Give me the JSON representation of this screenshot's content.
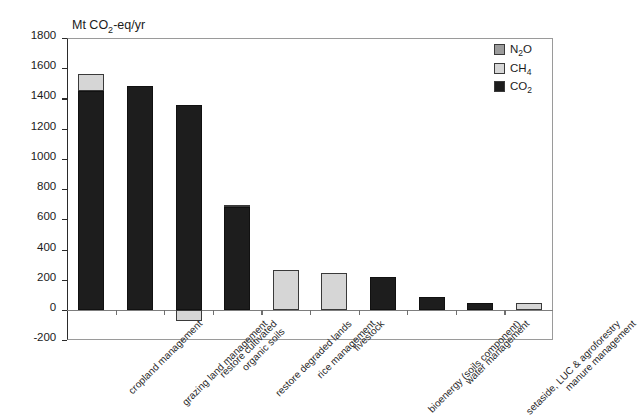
{
  "chart_data": {
    "type": "bar",
    "stacked": true,
    "title": "Mt CO2-eq/yr",
    "title_html": "Mt CO<sub>2</sub>-eq/yr",
    "xlabel": "",
    "ylabel": "Mt CO2-eq/yr",
    "ylim": [
      -200,
      1800
    ],
    "ytick_step": 200,
    "yticks": [
      1800,
      1600,
      1400,
      1200,
      1000,
      800,
      600,
      400,
      200,
      0,
      -200
    ],
    "ytick_labels": [
      "1800",
      "1600",
      "1400",
      "1200",
      "1000",
      "800",
      "600",
      "400",
      "200",
      "0",
      "-200"
    ],
    "grid": false,
    "legend_position": "top-right",
    "categories": [
      "cropland management",
      "grazing land management",
      "restore cultivated organic soils",
      "restore degraded lands",
      "rice management",
      "livestock",
      "bioenergy (soils component)",
      "water management",
      "setaside, LUC & agroforestry",
      "manure management"
    ],
    "category_lines": [
      [
        "cropland management"
      ],
      [
        "grazing land management"
      ],
      [
        "restore cultivated",
        "organic soils"
      ],
      [
        "restore degraded lands"
      ],
      [
        "rice management"
      ],
      [
        "livestock"
      ],
      [
        "bioenergy (soils component)"
      ],
      [
        "water management"
      ],
      [
        "setaside, LUC & agroforestry"
      ],
      [
        "manure management"
      ]
    ],
    "series": [
      {
        "name": "CO2",
        "name_html": "CO<sub>2</sub>",
        "color": "#1d1d1d",
        "values": [
          1450,
          1480,
          1355,
          680,
          0,
          0,
          220,
          85,
          45,
          0
        ]
      },
      {
        "name": "CH4",
        "name_html": "CH<sub>4</sub>",
        "color": "#d6d6d6",
        "values": [
          115,
          0,
          0,
          15,
          265,
          245,
          0,
          0,
          0,
          45
        ]
      },
      {
        "name": "N2O",
        "name_html": "N<sub>2</sub>O",
        "color": "#9b9b9b",
        "values": [
          0,
          0,
          -75,
          0,
          0,
          0,
          0,
          0,
          0,
          0
        ]
      }
    ],
    "totals": [
      1565,
      1480,
      1355,
      695,
      265,
      245,
      220,
      85,
      45,
      45
    ]
  },
  "legend": {
    "items": [
      {
        "label": "N2O",
        "label_html": "N<sub>2</sub>O",
        "color": "#9b9b9b"
      },
      {
        "label": "CH4",
        "label_html": "CH<sub>4</sub>",
        "color": "#d6d6d6"
      },
      {
        "label": "CO2",
        "label_html": "CO<sub>2</sub>",
        "color": "#1d1d1d"
      }
    ]
  },
  "colors": {
    "background": "#ffffff",
    "axis": "#2b2b2b",
    "frame": "#9a9a9a",
    "text": "#1b1b1b",
    "co2": "#1d1d1d",
    "ch4": "#d6d6d6",
    "n2o": "#9b9b9b"
  }
}
